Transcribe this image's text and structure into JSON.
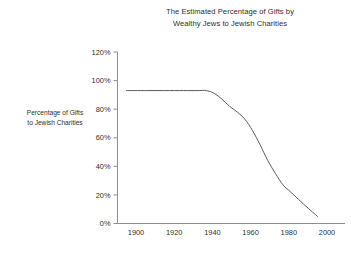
{
  "chart_data": {
    "type": "line",
    "title": "The Estimated Percentage of Gifts by\nWealthy Jews to Jewish Charities",
    "xlabel": "",
    "ylabel": "Percentage of Gifts\nto Jewish Charities",
    "xlim": [
      1890,
      2005
    ],
    "ylim": [
      0,
      120
    ],
    "grid": false,
    "legend": "none",
    "x_tick_labels": [
      "1900",
      "1920",
      "1940",
      "1960",
      "1980",
      "2000"
    ],
    "x_ticks": [
      1900,
      1920,
      1940,
      1960,
      1980,
      2000
    ],
    "y_tick_labels": [
      "120%",
      "100%",
      "80%",
      "60%",
      "40%",
      "20%",
      "0%"
    ],
    "y_ticks": [
      120,
      100,
      80,
      60,
      40,
      20,
      0
    ],
    "series": [
      {
        "name": "Percentage of Gifts to Jewish Charities",
        "color": "#5a5a5a",
        "x": [
          1895,
          1905,
          1915,
          1925,
          1932,
          1937,
          1941,
          1945,
          1949,
          1953,
          1957,
          1961,
          1965,
          1969,
          1973,
          1977,
          1981,
          1985,
          1989,
          1995
        ],
        "y": [
          93,
          93,
          93,
          93,
          93,
          93,
          91,
          87,
          82,
          78,
          73,
          65,
          55,
          44,
          35,
          27,
          22,
          17,
          12,
          5
        ]
      }
    ]
  },
  "colors": {
    "background": "#ffffff",
    "text": "#2e2e2e",
    "axis": "#8d8d8d",
    "line": "#5a5a5a"
  }
}
